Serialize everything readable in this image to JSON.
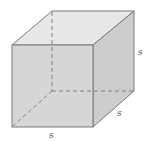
{
  "diagram": {
    "labels": {
      "height": "s",
      "depth": "s",
      "width": "s"
    },
    "colors": {
      "front_face": "#d6d6d6",
      "top_face": "#e8e8e8",
      "right_face": "#cdcdcd",
      "edge": "#7a7a7a",
      "hidden_edge": "#808080",
      "label": "#555555"
    }
  }
}
